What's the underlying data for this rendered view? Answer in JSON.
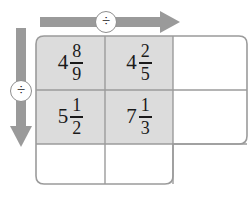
{
  "diagram": {
    "colors": {
      "arrow": "#9a9a9a",
      "shaded_cell": "#dcdcdc",
      "cell_border": "#9b9b9b",
      "outline": "#9b9b9b",
      "text": "#1a1a1a",
      "badge_background": "#ffffff",
      "badge_border": "#8e8e8e"
    },
    "operators": {
      "top": {
        "symbol": "÷",
        "icon_name": "division-sign-icon",
        "direction": "right"
      },
      "left": {
        "symbol": "÷",
        "icon_name": "division-sign-icon",
        "direction": "down"
      }
    },
    "grid": {
      "rows": 3,
      "columns": 3,
      "cells": [
        [
          {
            "whole": "4",
            "numerator": "8",
            "denominator": "9",
            "shaded": true,
            "text": "4 8/9"
          },
          {
            "whole": "4",
            "numerator": "2",
            "denominator": "5",
            "shaded": true,
            "text": "4 2/5"
          },
          {
            "whole": "",
            "numerator": "",
            "denominator": "",
            "shaded": false,
            "text": ""
          }
        ],
        [
          {
            "whole": "5",
            "numerator": "1",
            "denominator": "2",
            "shaded": true,
            "text": "5 1/2"
          },
          {
            "whole": "7",
            "numerator": "1",
            "denominator": "3",
            "shaded": true,
            "text": "7 1/3"
          },
          {
            "whole": "",
            "numerator": "",
            "denominator": "",
            "shaded": false,
            "text": ""
          }
        ],
        [
          {
            "whole": "",
            "numerator": "",
            "denominator": "",
            "shaded": false,
            "text": ""
          },
          {
            "whole": "",
            "numerator": "",
            "denominator": "",
            "shaded": false,
            "text": ""
          },
          {
            "whole": "",
            "numerator": "",
            "denominator": "",
            "shaded": false,
            "text": ""
          }
        ]
      ]
    }
  }
}
